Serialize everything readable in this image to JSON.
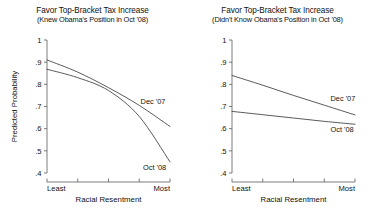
{
  "figure": {
    "background": "#ffffff",
    "line_color": "#3c3c3c",
    "axis_color": "#5a5a5a"
  },
  "chart_data": [
    {
      "type": "line",
      "panel_id": "left",
      "title": "Favor Top-Bracket Tax Increase",
      "subtitle": "(Knew Obama's Position in Oct '08)",
      "xlabel": "Racial Resentment",
      "ylabel": "Predicted Probability",
      "ylim": [
        0.4,
        1.0
      ],
      "yticks": [
        0.4,
        0.5,
        0.6,
        0.7,
        0.8,
        0.9,
        1.0
      ],
      "ytick_labels": [
        ".4",
        ".5",
        ".6",
        ".7",
        ".8",
        ".9",
        "1"
      ],
      "xlim": [
        0,
        1
      ],
      "xticks": [
        0,
        0.25,
        0.5,
        0.75,
        1
      ],
      "xtick_labels": [
        "Least",
        "",
        "",
        "",
        "Most"
      ],
      "grid": false,
      "legend": "inline-annotation",
      "x": [
        0,
        0.25,
        0.5,
        0.75,
        1
      ],
      "series": [
        {
          "name": "Dec '07",
          "label": "Dec '07",
          "values": [
            0.91,
            0.855,
            0.785,
            0.705,
            0.61
          ],
          "label_anchor": {
            "x": 0.72,
            "y": 0.705
          }
        },
        {
          "name": "Oct '08",
          "label": "Oct '08",
          "values": [
            0.868,
            0.83,
            0.772,
            0.655,
            0.45
          ],
          "label_anchor": {
            "x": 0.74,
            "y": 0.452
          }
        }
      ],
      "annotations": [
        {
          "text": "Dec '07",
          "note": "label on upper-right curve"
        },
        {
          "text": "Oct '08",
          "note": "label on lower-right curve"
        }
      ]
    },
    {
      "type": "line",
      "panel_id": "right",
      "title": "Favor Top-Bracket Tax Increase",
      "subtitle": "(Didn't Know Obama's Position in Oct '08)",
      "xlabel": "Racial Resentment",
      "ylabel": "",
      "ylim": [
        0.4,
        1.0
      ],
      "yticks": [
        0.4,
        0.5,
        0.6,
        0.7,
        0.8,
        0.9,
        1.0
      ],
      "ytick_labels": [
        ".4",
        ".5",
        ".6",
        ".7",
        ".8",
        ".9",
        "1"
      ],
      "xlim": [
        0,
        1
      ],
      "xticks": [
        0,
        0.25,
        0.5,
        0.75,
        1
      ],
      "xtick_labels": [
        "Least",
        "",
        "",
        "",
        "Most"
      ],
      "grid": false,
      "legend": "inline-annotation",
      "x": [
        0,
        0.25,
        0.5,
        0.75,
        1
      ],
      "series": [
        {
          "name": "Dec '07",
          "label": "Dec '07",
          "values": [
            0.84,
            0.796,
            0.75,
            0.706,
            0.662
          ],
          "label_anchor": {
            "x": 0.76,
            "y": 0.712
          }
        },
        {
          "name": "Oct '08",
          "label": "Oct '08",
          "values": [
            0.678,
            0.663,
            0.648,
            0.633,
            0.62
          ],
          "label_anchor": {
            "x": 0.76,
            "y": 0.622
          }
        }
      ],
      "annotations": [
        {
          "text": "Dec '07",
          "note": "label on upper curve"
        },
        {
          "text": "Oct '08",
          "note": "label on lower curve"
        }
      ]
    }
  ]
}
